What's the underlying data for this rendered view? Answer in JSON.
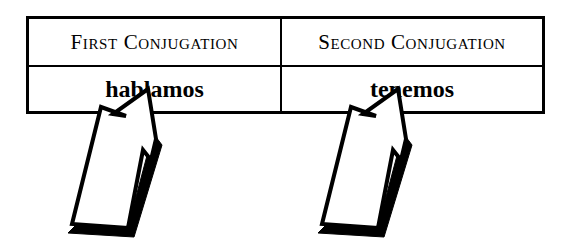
{
  "figure": {
    "background_color": "#ffffff",
    "ink_color": "#000000",
    "caption": ""
  },
  "table": {
    "columns": [
      {
        "header": "First Conjugation",
        "verb_form": "hablamos",
        "arrow": {
          "name": "callout-arrow-first-conjugation",
          "direction": "up-right",
          "style": "outlined-block-arrow-with-shadow"
        }
      },
      {
        "header": "Second Conjugation",
        "verb_form": "tenemos",
        "arrow": {
          "name": "callout-arrow-second-conjugation",
          "direction": "up-right",
          "style": "outlined-block-arrow-with-shadow"
        }
      }
    ]
  }
}
